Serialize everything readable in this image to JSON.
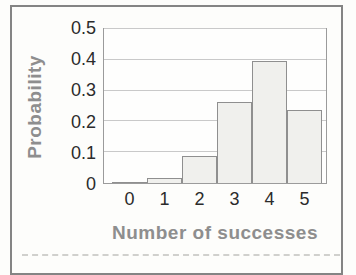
{
  "figure": {
    "background": "#fdfdfb",
    "frame_color": "#848484"
  },
  "chart_data": {
    "type": "bar",
    "title": "",
    "xlabel": "Number of successes",
    "ylabel": "Probability",
    "categories": [
      "0",
      "1",
      "2",
      "3",
      "4",
      "5"
    ],
    "values": [
      0.001,
      0.015,
      0.088,
      0.264,
      0.396,
      0.237
    ],
    "ylim": [
      0,
      0.5
    ],
    "yticks": [
      "0",
      "0.1",
      "0.2",
      "0.3",
      "0.4",
      "0.5"
    ],
    "grid": "horizontal",
    "legend": "none",
    "bar_style": "histogram-touching",
    "colors": {
      "bar_fill": "#f0f0ed",
      "bar_border": "#8f8f8f",
      "gridline": "#c9c9c9",
      "plot_border": "#9b9b9b",
      "tick_label": "#2b2b2b",
      "axis_title": "#8e8e8e"
    }
  }
}
